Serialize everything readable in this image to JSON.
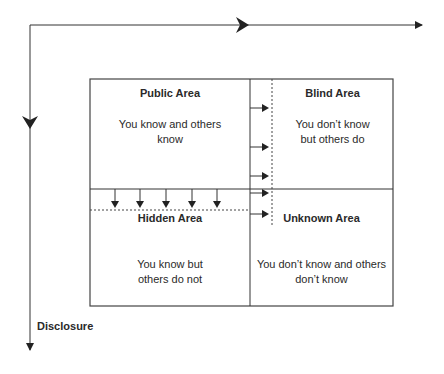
{
  "diagram": {
    "type": "johari-window",
    "quadrants": [
      {
        "id": "public",
        "title": "Public Area",
        "desc": "You know and others know"
      },
      {
        "id": "blind",
        "title": "Blind Area",
        "desc": "You don't know but others do"
      },
      {
        "id": "hidden",
        "title": "Hidden Area",
        "desc": "You know but others do not"
      },
      {
        "id": "unknown",
        "title": "Unknown Area",
        "desc": "You don't know and others don't know"
      }
    ],
    "axes": {
      "vertical_label": "Disclosure"
    },
    "text": {
      "public_title": "Public Area",
      "public_desc_1": "You know and others",
      "public_desc_2": "know",
      "blind_title": "Blind Area",
      "blind_desc_1": "You don’t know",
      "blind_desc_2": "but others do",
      "hidden_title": "Hidden Area",
      "hidden_desc_1": "You know but",
      "hidden_desc_2": "others do not",
      "unknown_title": "Unknown Area",
      "unknown_desc_1": "You don’t know and others",
      "unknown_desc_2": "don’t know",
      "disclosure": "Disclosure"
    },
    "colors": {
      "line": "#333333",
      "background": "#ffffff"
    }
  }
}
